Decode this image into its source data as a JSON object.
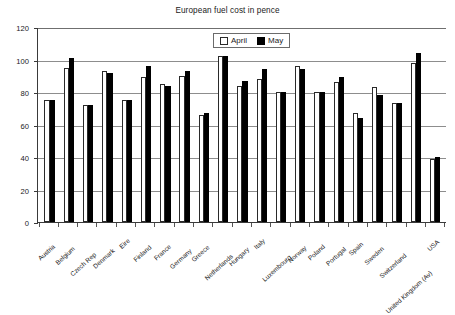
{
  "chart_data": {
    "type": "bar",
    "title": "European fuel cost in pence",
    "xlabel": "",
    "ylabel": "",
    "ylim": [
      0,
      120
    ],
    "yticks": [
      0,
      20,
      40,
      60,
      80,
      100,
      120
    ],
    "grid": true,
    "legend_position": "top-center",
    "categories": [
      "Austria",
      "Belgium",
      "Czech Rep",
      "Denmark",
      "Eire",
      "Finland",
      "France",
      "Germany",
      "Greece",
      "Netherlands",
      "Hungary",
      "Italy",
      "Luxembourg",
      "Norway",
      "Poland",
      "Portugal",
      "Spain",
      "Sweden",
      "Switzerland",
      "United Kingdom (Av)",
      "USA"
    ],
    "series": [
      {
        "name": "April",
        "color": "#ffffff",
        "values": [
          75,
          95,
          72,
          93,
          75,
          89,
          85,
          90,
          66,
          102,
          84,
          88,
          80,
          96,
          80,
          86,
          67,
          83,
          73,
          98,
          39
        ]
      },
      {
        "name": "May",
        "color": "#000000",
        "values": [
          75,
          101,
          72,
          92,
          75,
          96,
          84,
          93,
          67,
          102,
          87,
          94,
          80,
          94,
          80,
          89,
          64,
          78,
          73,
          104,
          40
        ]
      }
    ]
  },
  "legend": {
    "items": [
      {
        "label": "April",
        "style": "april"
      },
      {
        "label": "May",
        "style": "may"
      }
    ]
  }
}
